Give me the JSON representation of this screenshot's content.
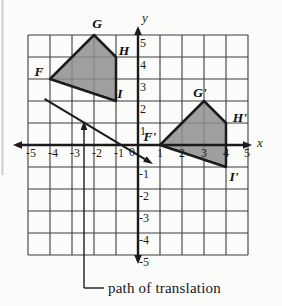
{
  "figure": {
    "axis_labels": {
      "x": "x",
      "y": "y"
    },
    "x_ticks": [
      "-5",
      "-4",
      "-3",
      "-2",
      "-1",
      "0",
      "1",
      "2",
      "3",
      "4",
      "5"
    ],
    "y_ticks_pos": [
      "5",
      "4",
      "3",
      "2",
      "1"
    ],
    "y_ticks_neg": [
      "-1",
      "-2",
      "-3",
      "-4",
      "-5"
    ],
    "caption": "path of translation",
    "colors": {
      "background": "#fbfbfa",
      "grid": "#3d3d3d",
      "axis": "#1b1b1b",
      "shape_fill": "#8e8e8e",
      "shape_stroke": "#1b1b1b"
    },
    "preimage": {
      "vertices": [
        {
          "label": "F",
          "x": -4,
          "y": 3
        },
        {
          "label": "G",
          "x": -2,
          "y": 5
        },
        {
          "label": "H",
          "x": -1,
          "y": 4
        },
        {
          "label": "I",
          "x": -1,
          "y": 2
        }
      ]
    },
    "image": {
      "vertices": [
        {
          "label": "F'",
          "x": 1,
          "y": 0
        },
        {
          "label": "G'",
          "x": 3,
          "y": 2
        },
        {
          "label": "H'",
          "x": 4,
          "y": 1
        },
        {
          "label": "I'",
          "x": 4,
          "y": -1
        }
      ]
    },
    "translation": {
      "path": {
        "from": {
          "x": -4.25,
          "y": 2.1
        },
        "to": {
          "x": 0.68,
          "y": -0.86
        }
      }
    }
  },
  "chart_data": {
    "type": "polygon-translation-diagram",
    "axes": {
      "xlim": [
        -5,
        5
      ],
      "ylim": [
        -5,
        5
      ],
      "grid": true,
      "xlabel": "x",
      "ylabel": "y"
    },
    "preimage_FGHI": [
      [
        -4,
        3
      ],
      [
        -2,
        5
      ],
      [
        -1,
        4
      ],
      [
        -1,
        2
      ]
    ],
    "image_FGHI_prime": [
      [
        1,
        0
      ],
      [
        3,
        2
      ],
      [
        4,
        1
      ],
      [
        4,
        -1
      ]
    ],
    "translation_vector": [
      5,
      -3
    ],
    "annotation": "path of translation"
  }
}
